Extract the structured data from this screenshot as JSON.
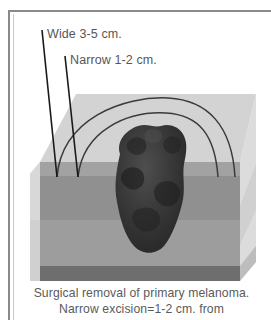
{
  "figure": {
    "kind": "medical-illustration",
    "callouts": [
      {
        "id": "wide",
        "label": "Wide 3-5 cm."
      },
      {
        "id": "narrow",
        "label": "Narrow 1-2 cm."
      }
    ],
    "caption": {
      "line1": "Surgical removal of primary melanoma.",
      "line2": "Narrow excision=1-2 cm. from"
    },
    "colors": {
      "frame": "#8a8a8a",
      "frame_inner": "#c9c9c9",
      "label_text": "#575757",
      "caption_text": "#5a5a5a",
      "leader_line": "#1a1a1a",
      "arc_line": "#3a3a3a",
      "block_top": "#d3d3d3",
      "block_left": "#c3c3c3",
      "block_right": "#dcdcdc",
      "epidermis": "#9a9a9a",
      "dermis": "#8f8f8f",
      "subcutis": "#9d9d9d",
      "fascia": "#6e6e6e",
      "lesion_dark": "#2e2e2e",
      "lesion_mid": "#3d3d3d",
      "lesion_light": "#4c4c4c"
    }
  }
}
